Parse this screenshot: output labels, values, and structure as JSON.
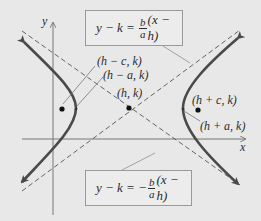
{
  "diagram": {
    "type": "hyperbola-horizontal-transverse-axis",
    "background": "#e8e8e8",
    "curve_color": "#4a4a4a",
    "asymptote_color": "#555555",
    "axes": {
      "x_label": "x",
      "y_label": "y"
    },
    "points": [
      {
        "id": "focus-left",
        "label": "(h − c, k)"
      },
      {
        "id": "vertex-left",
        "label": "(h − a, k)"
      },
      {
        "id": "center",
        "label": "(h, k)"
      },
      {
        "id": "focus-right",
        "label": "(h + c, k)"
      },
      {
        "id": "vertex-right",
        "label": "(h + a, k)"
      }
    ],
    "asymptotes": {
      "positive": {
        "lhs": "y − k = ",
        "sign": "",
        "frac_num": "b",
        "frac_den": "a",
        "rhs": "(x − h)"
      },
      "negative": {
        "lhs": "y − k = ",
        "sign": "−",
        "frac_num": "b",
        "frac_den": "a",
        "rhs": "(x − h)"
      }
    }
  }
}
